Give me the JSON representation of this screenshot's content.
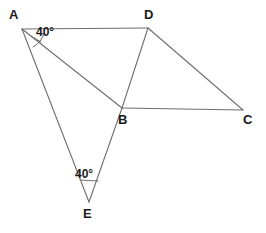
{
  "figure": {
    "background_color": "#ffffff",
    "line_color": "#6e6e6e",
    "label_color": "#1a1a1a"
  },
  "points": {
    "A": {
      "label": "A",
      "x": 22,
      "y": 29,
      "label_x": 9,
      "label_y": 8
    },
    "B": {
      "label": "B",
      "x": 122,
      "y": 108,
      "label_x": 118,
      "label_y": 113
    },
    "C": {
      "label": "C",
      "x": 243,
      "y": 110,
      "label_x": 243,
      "label_y": 113
    },
    "D": {
      "label": "D",
      "x": 148,
      "y": 28,
      "label_x": 144,
      "label_y": 8
    },
    "E": {
      "label": "E",
      "x": 89,
      "y": 202,
      "label_x": 83,
      "label_y": 207
    }
  },
  "edges": [
    {
      "name": "segment-AD",
      "from": "A",
      "to": "D"
    },
    {
      "name": "segment-DC",
      "from": "D",
      "to": "C"
    },
    {
      "name": "segment-BC",
      "from": "B",
      "to": "C"
    },
    {
      "name": "segment-DB",
      "from": "D",
      "to": "B"
    },
    {
      "name": "segment-AB",
      "from": "A",
      "to": "B"
    },
    {
      "name": "segment-AE",
      "from": "A",
      "to": "E"
    },
    {
      "name": "segment-BE",
      "from": "B",
      "to": "E"
    }
  ],
  "angles": [
    {
      "name": "angle-at-A",
      "vertex": "A",
      "value": "40°",
      "label_x": 36,
      "label_y": 26,
      "arc_path": "M 44 33 A 22 22 0 0 1 33 47",
      "tick_path": "M 30 35 L 40 41"
    },
    {
      "name": "angle-at-E",
      "vertex": "E",
      "value": "40°",
      "label_x": 75,
      "label_y": 168,
      "arc_path": "M 80 179 A 24 24 0 0 0 98 180",
      "tick_path": "M 80 181 L 98 182"
    }
  ]
}
